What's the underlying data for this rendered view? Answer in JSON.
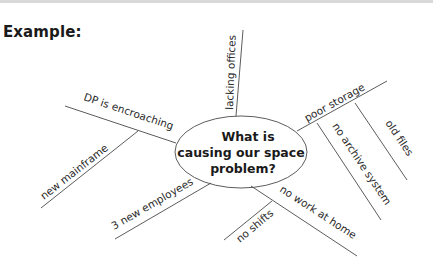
{
  "heading": "Example:",
  "center": {
    "lines": [
      "What is",
      "causing our space",
      "problem?"
    ]
  },
  "branches": {
    "lacking_offices": "lacking offices",
    "dp_encroaching": "DP is encroaching",
    "new_mainframe": "new mainframe",
    "three_new_employees": "3 new employees",
    "no_work_at_home": "no work at home",
    "no_shifts": "no shifts",
    "poor_storage": "poor storage",
    "no_archive_system": "no archive system",
    "old_files": "old files"
  },
  "colors": {
    "line": "#4a4a4a",
    "text": "#2a2a2a",
    "topbar": "#d9d9d9"
  }
}
